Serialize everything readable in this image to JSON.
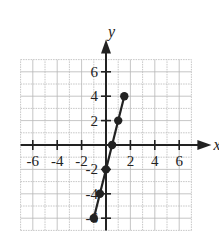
{
  "chart_data": {
    "type": "line",
    "title": "",
    "xlabel": "x",
    "ylabel": "y",
    "xlim": [
      -7,
      7
    ],
    "ylim": [
      -7,
      7
    ],
    "grid": true,
    "grid_step": 1,
    "x_ticks": [
      "-6",
      "-4",
      "-2",
      "2",
      "4",
      "6"
    ],
    "y_ticks": [
      "6",
      "4",
      "2",
      "-2",
      "-4",
      "-6"
    ],
    "series": [
      {
        "name": "y = 4x - 2",
        "points": [
          {
            "x": -1,
            "y": -6
          },
          {
            "x": -0.5,
            "y": -4
          },
          {
            "x": 0,
            "y": -2
          },
          {
            "x": 0.5,
            "y": 0
          },
          {
            "x": 1,
            "y": 2
          },
          {
            "x": 1.5,
            "y": 4
          }
        ]
      }
    ],
    "colors": {
      "ink": "#222222",
      "grid": "#b8b8b8"
    }
  }
}
